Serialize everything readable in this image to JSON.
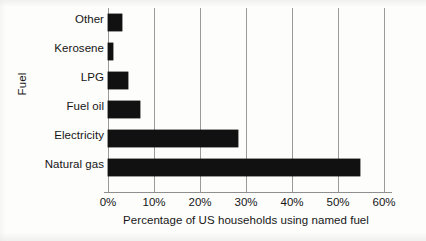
{
  "chart_data": {
    "type": "bar",
    "orientation": "horizontal",
    "title": "",
    "xlabel": "Percentage of US households using named fuel",
    "ylabel": "Fuel",
    "categories": [
      "Other",
      "Kerosene",
      "LPG",
      "Fuel oil",
      "Electricity",
      "Natural gas"
    ],
    "values": [
      3.0,
      1.0,
      4.3,
      7.0,
      28.3,
      54.8
    ],
    "series": [
      {
        "name": "Percentage of US households using named fuel",
        "values": [
          3.0,
          1.0,
          4.3,
          7.0,
          28.3,
          54.8
        ]
      }
    ],
    "xlim": [
      0,
      60
    ],
    "ylim": null,
    "xticks": [
      0,
      10,
      20,
      30,
      40,
      50,
      60
    ],
    "xtick_labels": [
      "0%",
      "10%",
      "20%",
      "30%",
      "40%",
      "50%",
      "60%"
    ],
    "grid": true,
    "grid_axis": "x",
    "legend": false,
    "legend_position": "none",
    "bar_color": "#111111",
    "gridline_color": "#9a9a9a",
    "axis_color": "#8f8f8f",
    "background_color": "#fdfdfc",
    "annotations": []
  }
}
